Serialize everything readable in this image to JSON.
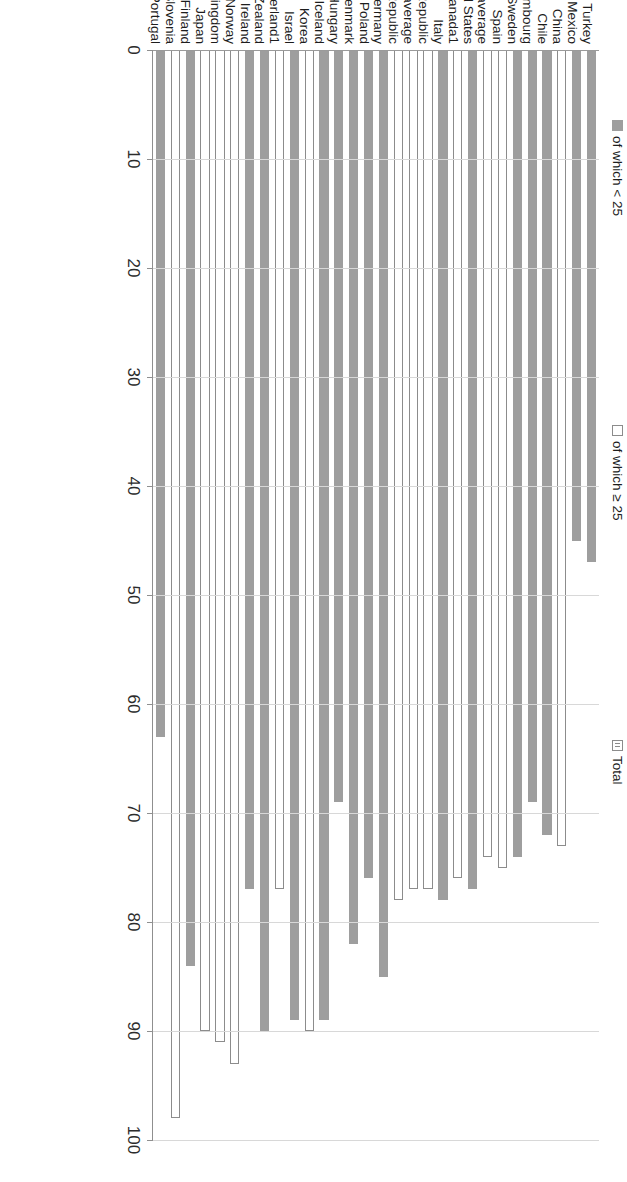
{
  "chart_data": {
    "type": "bar",
    "orientation": "vertical-rendered-rotated",
    "title": "",
    "xlabel": "",
    "ylabel": "",
    "ylim": [
      0,
      100
    ],
    "yticks": [
      0,
      10,
      20,
      30,
      40,
      50,
      60,
      70,
      80,
      90,
      100
    ],
    "grid": true,
    "legend_position": "top",
    "legend": [
      {
        "label": "of which < 25",
        "marker": "filled-square"
      },
      {
        "label": "of which ≥ 25",
        "marker": "hollow-square"
      },
      {
        "label": "Total",
        "marker": "hatched-square"
      }
    ],
    "categories": [
      "Portugal",
      "Slovenia",
      "Finland",
      "Japan",
      "United Kingdom",
      "Norway",
      "Ireland",
      "New Zealand",
      "Switzerland1",
      "Israel",
      "Korea",
      "Iceland",
      "Hungary",
      "Denmark",
      "Poland",
      "Germany",
      "Czech Republic",
      "OECD average",
      "Slovak Republic",
      "Italy",
      "Canada1",
      "United States",
      "G20 average",
      "Spain",
      "Sweden",
      "Luxembourg",
      "Chile",
      "China",
      "Mexico",
      "Turkey"
    ],
    "values": [
      63,
      98,
      84,
      90,
      91,
      93,
      77,
      90,
      77,
      89,
      90,
      89,
      69,
      82,
      76,
      85,
      78,
      77,
      77,
      78,
      76,
      77,
      74,
      75,
      74,
      69,
      72,
      73,
      45,
      47
    ],
    "styles": [
      "filled",
      "hollow",
      "filled",
      "hollow",
      "hollow",
      "hollow",
      "filled",
      "filled",
      "hollow",
      "filled",
      "hollow",
      "filled",
      "filled",
      "filled",
      "filled",
      "filled",
      "hollow",
      "hollow",
      "hollow",
      "filled",
      "hollow",
      "filled",
      "hollow",
      "hollow",
      "filled",
      "filled",
      "filled",
      "hollow",
      "filled",
      "filled"
    ]
  }
}
